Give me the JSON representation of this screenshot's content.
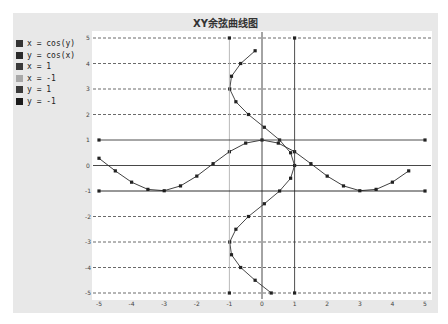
{
  "chart_data": {
    "type": "line",
    "title": "XY余弦曲线图",
    "xlabel": "",
    "ylabel": "",
    "xlim": [
      -5,
      5
    ],
    "ylim": [
      -5,
      5
    ],
    "x_ticks": [
      "-5",
      "-4",
      "-3",
      "-2",
      "-1",
      "0",
      "1",
      "2",
      "3",
      "4",
      "5"
    ],
    "y_ticks": [
      "5",
      "4",
      "3",
      "2",
      "1",
      "0",
      "-1",
      "-2",
      "-3",
      "-4",
      "-5"
    ],
    "grid": "horizontal dashed",
    "legend_position": "left",
    "series": [
      {
        "name": "x = cos(y)",
        "color": "#333333",
        "markers": true,
        "points": [
          [
            0.284,
            -5
          ],
          [
            -0.211,
            -4.5
          ],
          [
            -0.654,
            -4
          ],
          [
            -0.936,
            -3.5
          ],
          [
            -0.99,
            -3
          ],
          [
            -0.801,
            -2.5
          ],
          [
            -0.416,
            -2
          ],
          [
            0.071,
            -1.5
          ],
          [
            0.54,
            -1
          ],
          [
            0.878,
            -0.5
          ],
          [
            1.0,
            0
          ],
          [
            0.878,
            0.5
          ],
          [
            0.54,
            1
          ],
          [
            0.071,
            1.5
          ],
          [
            -0.416,
            2
          ],
          [
            -0.801,
            2.5
          ],
          [
            -0.99,
            3
          ],
          [
            -0.936,
            3.5
          ],
          [
            -0.654,
            4
          ],
          [
            -0.211,
            4.5
          ]
        ]
      },
      {
        "name": "y = cos(x)",
        "color": "#2a2a2a",
        "markers": true,
        "points": [
          [
            -5,
            0.284
          ],
          [
            -4.5,
            -0.211
          ],
          [
            -4,
            -0.654
          ],
          [
            -3.5,
            -0.936
          ],
          [
            -3,
            -0.99
          ],
          [
            -2.5,
            -0.801
          ],
          [
            -2,
            -0.416
          ],
          [
            -1.5,
            0.071
          ],
          [
            -1,
            0.54
          ],
          [
            -0.5,
            0.878
          ],
          [
            0,
            1.0
          ],
          [
            0.5,
            0.878
          ],
          [
            1,
            0.54
          ],
          [
            1.5,
            0.071
          ],
          [
            2,
            -0.416
          ],
          [
            2.5,
            -0.801
          ],
          [
            3,
            -0.99
          ],
          [
            3.5,
            -0.936
          ],
          [
            4,
            -0.654
          ],
          [
            4.5,
            -0.211
          ]
        ]
      },
      {
        "name": "x = 1",
        "color": "#3a3a3a",
        "markers": true,
        "points": [
          [
            1,
            -5
          ],
          [
            1,
            5
          ]
        ]
      },
      {
        "name": "x = -1",
        "color": "#a8a8a8",
        "markers": true,
        "points": [
          [
            -1,
            -5
          ],
          [
            -1,
            5
          ]
        ]
      },
      {
        "name": "y = 1",
        "color": "#3a3a3a",
        "markers": true,
        "points": [
          [
            -5,
            1
          ],
          [
            5,
            1
          ]
        ]
      },
      {
        "name": "y = -1",
        "color": "#1a1a1a",
        "markers": true,
        "points": [
          [
            -5,
            -1
          ],
          [
            5,
            -1
          ]
        ]
      }
    ]
  },
  "legend": [
    {
      "label": "x = cos(y)",
      "color": "#333333"
    },
    {
      "label": "y = cos(x)",
      "color": "#2a2a2a"
    },
    {
      "label": "x = 1",
      "color": "#3a3a3a"
    },
    {
      "label": "x = -1",
      "color": "#a8a8a8"
    },
    {
      "label": "y = 1",
      "color": "#3a3a3a"
    },
    {
      "label": "y = -1",
      "color": "#1a1a1a"
    }
  ]
}
